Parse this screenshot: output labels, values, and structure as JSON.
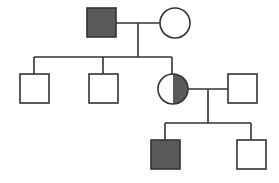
{
  "diagram": {
    "type": "pedigree",
    "colors": {
      "affected": "#5a5a5a",
      "unaffected": "#ffffff",
      "line": "#333333"
    },
    "generations": [
      {
        "label": "Generation I",
        "individuals": [
          {
            "id": "I-1",
            "sex": "male",
            "status": "affected"
          },
          {
            "id": "I-2",
            "sex": "female",
            "status": "unaffected"
          }
        ]
      },
      {
        "label": "Generation II",
        "individuals": [
          {
            "id": "II-1",
            "sex": "male",
            "status": "unaffected"
          },
          {
            "id": "II-2",
            "sex": "male",
            "status": "unaffected"
          },
          {
            "id": "II-3",
            "sex": "female",
            "status": "carrier"
          },
          {
            "id": "II-4",
            "sex": "male",
            "status": "unaffected",
            "note": "spouse"
          }
        ]
      },
      {
        "label": "Generation III",
        "individuals": [
          {
            "id": "III-1",
            "sex": "male",
            "status": "affected"
          },
          {
            "id": "III-2",
            "sex": "male",
            "status": "unaffected"
          }
        ]
      }
    ]
  }
}
